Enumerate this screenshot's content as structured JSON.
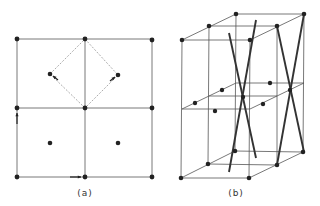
{
  "figures": {
    "a": {
      "label": "(a)",
      "label_pos": [
        85,
        188
      ],
      "grid": {
        "xs": [
          17,
          85,
          152
        ],
        "ys": [
          39,
          108,
          177
        ]
      },
      "lattice_points": [
        [
          17,
          39
        ],
        [
          85,
          39
        ],
        [
          152,
          40
        ],
        [
          17,
          108
        ],
        [
          85,
          108
        ],
        [
          152,
          108
        ],
        [
          17,
          177
        ],
        [
          85,
          177
        ],
        [
          152,
          177
        ]
      ],
      "interior_points": [
        [
          50,
          74
        ],
        [
          118,
          75
        ],
        [
          50,
          143
        ],
        [
          118,
          143
        ]
      ],
      "dashed_diamond": [
        [
          85,
          39
        ],
        [
          118,
          75
        ],
        [
          85,
          108
        ],
        [
          50,
          74
        ]
      ],
      "arrows": [
        {
          "from": [
            17,
            124
          ],
          "to": [
            17,
            113
          ],
          "note": "up-arrow-left-edge"
        },
        {
          "from": [
            70,
            177
          ],
          "to": [
            81,
            177
          ],
          "note": "right-arrow-bottom-edge"
        },
        {
          "from": [
            58,
            80
          ],
          "to": [
            53,
            76
          ],
          "note": "arrow-to-left-diamond-point"
        },
        {
          "from": [
            110,
            81
          ],
          "to": [
            115,
            77
          ],
          "note": "arrow-to-right-diamond-point"
        }
      ]
    },
    "b": {
      "label": "(b)",
      "label_pos": [
        236,
        188
      ],
      "layers": [
        {
          "name": "top",
          "front_left": [
            182,
            40
          ],
          "front_right": [
            250,
            40
          ],
          "mid_left": [
            209,
            26
          ],
          "mid_right": [
            277,
            26
          ],
          "back_left": [
            236,
            14
          ],
          "back_right": [
            304,
            14
          ]
        },
        {
          "name": "middle",
          "front_left": [
            182,
            109
          ],
          "front_right": [
            250,
            109
          ],
          "mid_left": [
            209,
            96
          ],
          "mid_right": [
            277,
            96
          ],
          "back_left": [
            236,
            83
          ],
          "back_right": [
            304,
            83
          ]
        },
        {
          "name": "bottom",
          "front_left": [
            181,
            178
          ],
          "front_right": [
            249,
            178
          ],
          "mid_left": [
            208,
            164
          ],
          "mid_right": [
            277,
            165
          ],
          "back_left": [
            235,
            151
          ],
          "back_right": [
            303,
            152
          ]
        }
      ],
      "middle_points": [
        [
          195,
          103
        ],
        [
          222,
          90
        ],
        [
          215,
          111
        ],
        [
          270,
          83
        ],
        [
          263,
          104
        ],
        [
          243,
          97
        ],
        [
          290,
          90
        ]
      ],
      "diagonals": [
        [
          [
            229,
            33
          ],
          [
            256,
            158
          ]
        ],
        [
          [
            256,
            20
          ],
          [
            229,
            172
          ]
        ],
        [
          [
            277,
            26
          ],
          [
            304,
            152
          ]
        ],
        [
          [
            304,
            14
          ],
          [
            277,
            165
          ]
        ]
      ]
    }
  },
  "colors": {
    "line": "#555555",
    "dashed": "#888888",
    "dot": "#222222",
    "diagonal": "#333333"
  }
}
